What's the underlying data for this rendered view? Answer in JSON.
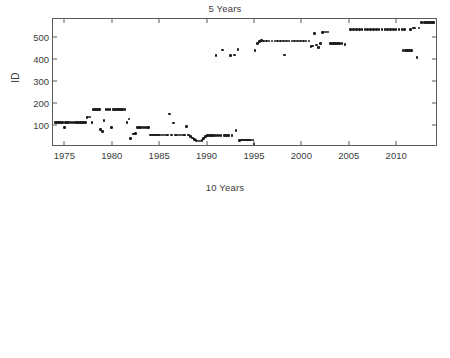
{
  "figure": {
    "background": "#ffffff",
    "marker_color": "#1a1a1a",
    "axis_color": "#5b5b5b",
    "text_color": "#3c3c3c"
  },
  "panels": [
    {
      "id": "five-years",
      "title": "5 Years",
      "ylabel": "ID"
    },
    {
      "id": "ten-years",
      "title": "10 Years",
      "ylabel": "ID"
    }
  ],
  "chart_data": [
    {
      "type": "scatter",
      "title": "5 Years",
      "xlabel": "",
      "ylabel": "ID",
      "xlim": [
        1973.8,
        2014.2
      ],
      "ylim": [
        10,
        580
      ],
      "xticks": [
        1975,
        1980,
        1985,
        1990,
        1995,
        2000,
        2005,
        2010
      ],
      "yticks": [
        100,
        200,
        300,
        400,
        500
      ],
      "grid": false,
      "legend": "none",
      "marker": "asterisk",
      "points": [
        [
          1974.0,
          112
        ],
        [
          1974.2,
          112
        ],
        [
          1974.4,
          112
        ],
        [
          1974.6,
          112
        ],
        [
          1974.8,
          112
        ],
        [
          1975.0,
          90
        ],
        [
          1975.1,
          112
        ],
        [
          1975.3,
          112
        ],
        [
          1975.5,
          112
        ],
        [
          1975.7,
          112
        ],
        [
          1975.9,
          112
        ],
        [
          1976.1,
          112
        ],
        [
          1976.3,
          112
        ],
        [
          1976.5,
          112
        ],
        [
          1976.7,
          112
        ],
        [
          1976.9,
          112
        ],
        [
          1977.0,
          112
        ],
        [
          1977.2,
          112
        ],
        [
          1977.4,
          135
        ],
        [
          1977.5,
          136
        ],
        [
          1977.7,
          137
        ],
        [
          1977.9,
          112
        ],
        [
          1978.1,
          170
        ],
        [
          1978.3,
          170
        ],
        [
          1978.5,
          170
        ],
        [
          1978.7,
          170
        ],
        [
          1978.8,
          80
        ],
        [
          1979.0,
          70
        ],
        [
          1979.2,
          120
        ],
        [
          1979.4,
          170
        ],
        [
          1979.6,
          170
        ],
        [
          1979.8,
          170
        ],
        [
          1980.0,
          90
        ],
        [
          1980.2,
          170
        ],
        [
          1980.4,
          170
        ],
        [
          1980.6,
          170
        ],
        [
          1980.8,
          170
        ],
        [
          1981.0,
          170
        ],
        [
          1981.2,
          170
        ],
        [
          1981.4,
          170
        ],
        [
          1981.6,
          112
        ],
        [
          1981.8,
          128
        ],
        [
          1982.0,
          40
        ],
        [
          1982.3,
          60
        ],
        [
          1982.5,
          62
        ],
        [
          1982.7,
          88
        ],
        [
          1982.9,
          88
        ],
        [
          1983.1,
          88
        ],
        [
          1983.3,
          88
        ],
        [
          1983.5,
          88
        ],
        [
          1983.7,
          88
        ],
        [
          1983.9,
          88
        ],
        [
          1984.1,
          55
        ],
        [
          1984.3,
          55
        ],
        [
          1984.5,
          55
        ],
        [
          1984.7,
          55
        ],
        [
          1984.9,
          55
        ],
        [
          1985.1,
          55
        ],
        [
          1985.3,
          55
        ],
        [
          1985.5,
          55
        ],
        [
          1985.7,
          55
        ],
        [
          1985.9,
          55
        ],
        [
          1986.1,
          150
        ],
        [
          1986.3,
          55
        ],
        [
          1986.5,
          110
        ],
        [
          1986.7,
          55
        ],
        [
          1986.9,
          55
        ],
        [
          1987.1,
          55
        ],
        [
          1987.3,
          55
        ],
        [
          1987.5,
          55
        ],
        [
          1987.7,
          55
        ],
        [
          1987.9,
          95
        ],
        [
          1988.1,
          55
        ],
        [
          1988.3,
          48
        ],
        [
          1988.5,
          42
        ],
        [
          1988.7,
          35
        ],
        [
          1988.9,
          30
        ],
        [
          1989.1,
          28
        ],
        [
          1989.3,
          28
        ],
        [
          1989.5,
          30
        ],
        [
          1989.7,
          40
        ],
        [
          1989.9,
          48
        ],
        [
          1990.1,
          52
        ],
        [
          1990.3,
          52
        ],
        [
          1990.5,
          52
        ],
        [
          1990.7,
          52
        ],
        [
          1990.9,
          52
        ],
        [
          1991.1,
          52
        ],
        [
          1991.0,
          415
        ],
        [
          1991.3,
          52
        ],
        [
          1991.5,
          52
        ],
        [
          1991.7,
          440
        ],
        [
          1991.9,
          52
        ],
        [
          1992.1,
          52
        ],
        [
          1992.3,
          52
        ],
        [
          1992.5,
          415
        ],
        [
          1992.7,
          52
        ],
        [
          1992.9,
          418
        ],
        [
          1993.0,
          418
        ],
        [
          1993.1,
          75
        ],
        [
          1993.3,
          443
        ],
        [
          1993.5,
          30
        ],
        [
          1993.7,
          32
        ],
        [
          1993.9,
          32
        ],
        [
          1994.1,
          32
        ],
        [
          1994.3,
          32
        ],
        [
          1994.5,
          32
        ],
        [
          1994.7,
          32
        ],
        [
          1994.9,
          32
        ],
        [
          1995.0,
          14
        ],
        [
          1995.1,
          438
        ],
        [
          1995.4,
          470
        ],
        [
          1995.6,
          478
        ],
        [
          1995.8,
          482
        ],
        [
          1996.0,
          480
        ],
        [
          1996.3,
          480
        ],
        [
          1996.6,
          480
        ],
        [
          1996.9,
          480
        ],
        [
          1997.2,
          480
        ],
        [
          1997.5,
          480
        ],
        [
          1997.8,
          480
        ],
        [
          1998.1,
          480
        ],
        [
          1998.2,
          417
        ],
        [
          1998.4,
          480
        ],
        [
          1998.7,
          480
        ],
        [
          1999.0,
          480
        ],
        [
          1999.3,
          480
        ],
        [
          1999.6,
          480
        ],
        [
          1999.9,
          480
        ],
        [
          2000.2,
          480
        ],
        [
          2000.5,
          480
        ],
        [
          2000.8,
          480
        ],
        [
          2001.0,
          455
        ],
        [
          2001.2,
          458
        ],
        [
          2001.4,
          515
        ],
        [
          2001.6,
          462
        ],
        [
          2001.8,
          452
        ],
        [
          2002.0,
          470
        ],
        [
          2002.2,
          520
        ],
        [
          2002.4,
          522
        ],
        [
          2002.6,
          522
        ],
        [
          2002.8,
          522
        ],
        [
          2003.0,
          468
        ],
        [
          2003.2,
          468
        ],
        [
          2003.4,
          468
        ],
        [
          2003.6,
          468
        ],
        [
          2003.8,
          468
        ],
        [
          2004.0,
          468
        ],
        [
          2004.3,
          468
        ],
        [
          2004.6,
          465
        ],
        [
          2005.2,
          532
        ],
        [
          2005.5,
          532
        ],
        [
          2005.8,
          533
        ],
        [
          2006.1,
          533
        ],
        [
          2006.4,
          533
        ],
        [
          2006.7,
          533
        ],
        [
          2007.0,
          533
        ],
        [
          2007.3,
          533
        ],
        [
          2007.6,
          533
        ],
        [
          2007.9,
          533
        ],
        [
          2008.2,
          533
        ],
        [
          2008.5,
          533
        ],
        [
          2008.8,
          533
        ],
        [
          2009.1,
          533
        ],
        [
          2009.4,
          533
        ],
        [
          2009.7,
          533
        ],
        [
          2010.0,
          533
        ],
        [
          2010.3,
          533
        ],
        [
          2010.6,
          533
        ],
        [
          2010.7,
          437
        ],
        [
          2010.9,
          533
        ],
        [
          2011.0,
          437
        ],
        [
          2011.2,
          437
        ],
        [
          2011.4,
          437
        ],
        [
          2011.5,
          533
        ],
        [
          2011.6,
          437
        ],
        [
          2011.8,
          540
        ],
        [
          2012.0,
          540
        ],
        [
          2012.2,
          405
        ],
        [
          2012.4,
          540
        ],
        [
          2012.7,
          565
        ],
        [
          2013.0,
          565
        ],
        [
          2013.2,
          565
        ],
        [
          2013.4,
          565
        ],
        [
          2013.6,
          565
        ],
        [
          2013.8,
          565
        ],
        [
          2014.0,
          565
        ]
      ]
    },
    {
      "type": "scatter",
      "title": "10 Years",
      "xlabel": "",
      "ylabel": "ID",
      "xlim": [
        1978.8,
        2014.2
      ],
      "ylim": [
        10,
        580
      ],
      "xticks": [
        1980,
        1985,
        1990,
        1995,
        2000,
        2005,
        2010
      ],
      "yticks": [
        100,
        200,
        300,
        400,
        500
      ],
      "grid": false,
      "legend": "none",
      "marker": "asterisk",
      "points": [
        [
          1979.0,
          112
        ],
        [
          1979.2,
          112
        ],
        [
          1979.4,
          112
        ],
        [
          1979.6,
          112
        ],
        [
          1979.8,
          112
        ],
        [
          1980.0,
          90
        ],
        [
          1980.2,
          112
        ],
        [
          1980.5,
          112
        ],
        [
          1980.8,
          112
        ],
        [
          1981.1,
          112
        ],
        [
          1981.4,
          112
        ],
        [
          1981.7,
          112
        ],
        [
          1982.0,
          112
        ],
        [
          1982.2,
          135
        ],
        [
          1982.4,
          112
        ],
        [
          1982.6,
          88
        ],
        [
          1982.9,
          88
        ],
        [
          1983.2,
          88
        ],
        [
          1983.5,
          88
        ],
        [
          1983.8,
          88
        ],
        [
          1984.1,
          88
        ],
        [
          1984.3,
          112
        ],
        [
          1984.6,
          112
        ],
        [
          1984.9,
          112
        ],
        [
          1985.0,
          125
        ],
        [
          1985.2,
          112
        ],
        [
          1985.5,
          112
        ],
        [
          1985.8,
          112
        ],
        [
          1986.1,
          112
        ],
        [
          1986.4,
          112
        ],
        [
          1986.7,
          112
        ],
        [
          1987.0,
          45
        ],
        [
          1987.1,
          112
        ],
        [
          1987.3,
          120
        ],
        [
          1987.5,
          128
        ],
        [
          1987.7,
          120
        ],
        [
          1987.9,
          130
        ],
        [
          1988.1,
          130
        ],
        [
          1988.3,
          130
        ],
        [
          1988.5,
          170
        ],
        [
          1988.7,
          55
        ],
        [
          1989.0,
          55
        ],
        [
          1989.3,
          55
        ],
        [
          1989.6,
          55
        ],
        [
          1989.9,
          55
        ],
        [
          1990.2,
          55
        ],
        [
          1990.5,
          55
        ],
        [
          1990.8,
          55
        ],
        [
          1991.1,
          55
        ],
        [
          1991.2,
          410
        ],
        [
          1991.4,
          412
        ],
        [
          1991.5,
          408
        ],
        [
          1991.6,
          410
        ],
        [
          1991.8,
          408
        ],
        [
          1992.0,
          440
        ],
        [
          1992.2,
          55
        ],
        [
          1993.0,
          95
        ],
        [
          1993.2,
          50
        ],
        [
          1993.4,
          50
        ],
        [
          1993.6,
          48
        ],
        [
          1993.8,
          42
        ],
        [
          1994.0,
          35
        ],
        [
          1994.2,
          32
        ],
        [
          1994.4,
          32
        ],
        [
          1994.6,
          35
        ],
        [
          1994.9,
          42
        ],
        [
          1995.1,
          48
        ],
        [
          1995.4,
          48
        ],
        [
          1995.7,
          48
        ],
        [
          1995.8,
          466
        ],
        [
          1996.0,
          48
        ],
        [
          1996.1,
          490
        ],
        [
          1996.3,
          48
        ],
        [
          1996.6,
          48
        ],
        [
          1996.9,
          48
        ],
        [
          1997.2,
          48
        ],
        [
          1997.5,
          48
        ],
        [
          1997.7,
          480
        ],
        [
          1998.0,
          480
        ],
        [
          1998.3,
          480
        ],
        [
          1998.6,
          480
        ],
        [
          1998.9,
          480
        ],
        [
          1999.2,
          480
        ],
        [
          1999.5,
          480
        ],
        [
          1999.8,
          480
        ],
        [
          2000.1,
          480
        ],
        [
          2000.2,
          14
        ],
        [
          2000.4,
          480
        ],
        [
          2000.7,
          480
        ],
        [
          2001.0,
          480
        ],
        [
          2001.3,
          480
        ],
        [
          2001.6,
          480
        ],
        [
          2001.9,
          480
        ],
        [
          2002.2,
          480
        ],
        [
          2002.4,
          522
        ],
        [
          2002.5,
          480
        ],
        [
          2002.8,
          480
        ],
        [
          2003.1,
          480
        ],
        [
          2003.3,
          417
        ],
        [
          2003.5,
          480
        ],
        [
          2003.8,
          480
        ],
        [
          2004.1,
          480
        ],
        [
          2004.4,
          480
        ],
        [
          2004.7,
          480
        ],
        [
          2005.0,
          480
        ],
        [
          2005.3,
          480
        ],
        [
          2005.6,
          533
        ],
        [
          2005.9,
          533
        ],
        [
          2006.2,
          533
        ],
        [
          2006.5,
          533
        ],
        [
          2006.8,
          533
        ],
        [
          2007.1,
          533
        ],
        [
          2007.4,
          533
        ],
        [
          2007.7,
          533
        ],
        [
          2008.0,
          533
        ],
        [
          2008.3,
          533
        ],
        [
          2008.6,
          533
        ],
        [
          2008.9,
          533
        ],
        [
          2009.2,
          533
        ],
        [
          2009.5,
          533
        ],
        [
          2009.8,
          533
        ],
        [
          2010.0,
          467
        ],
        [
          2010.1,
          533
        ],
        [
          2010.4,
          533
        ],
        [
          2010.7,
          533
        ],
        [
          2011.0,
          533
        ],
        [
          2011.3,
          533
        ],
        [
          2011.6,
          533
        ],
        [
          2011.9,
          533
        ],
        [
          2012.2,
          533
        ],
        [
          2012.5,
          533
        ],
        [
          2012.8,
          533
        ],
        [
          2013.1,
          533
        ],
        [
          2013.4,
          533
        ],
        [
          2013.7,
          533
        ],
        [
          2014.0,
          533
        ]
      ]
    }
  ]
}
